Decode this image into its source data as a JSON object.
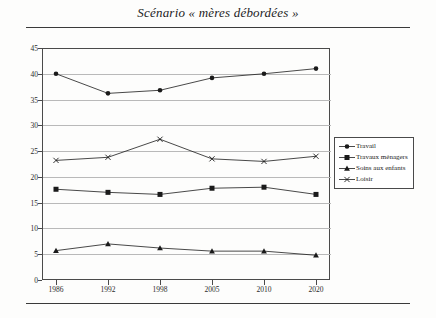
{
  "figure": {
    "title": "Scénario « mères débordées »"
  },
  "chart_data": {
    "type": "line",
    "title": "Scénario « mères débordées »",
    "xlabel": "",
    "ylabel": "",
    "categories": [
      "1986",
      "1992",
      "1998",
      "2005",
      "2010",
      "2020"
    ],
    "x": [
      1986,
      1992,
      1998,
      2005,
      2010,
      2020
    ],
    "ylim": [
      0,
      45
    ],
    "ytick_values": [
      0,
      5,
      10,
      15,
      20,
      25,
      30,
      35,
      40,
      45
    ],
    "ytick_labels": [
      "0",
      "5",
      "10",
      "15",
      "20",
      "25",
      "30",
      "35",
      "40",
      "45"
    ],
    "grid": true,
    "legend_position": "right",
    "series": [
      {
        "name": "Travail",
        "marker": "circle",
        "color": "#1a1a1a",
        "values": [
          40.0,
          36.2,
          36.8,
          39.2,
          40.0,
          41.0
        ]
      },
      {
        "name": "Travaux ménagers",
        "marker": "square",
        "color": "#1a1a1a",
        "values": [
          17.6,
          17.0,
          16.6,
          17.8,
          18.0,
          16.6
        ]
      },
      {
        "name": "Soins aux enfants",
        "marker": "triangle",
        "color": "#1a1a1a",
        "values": [
          5.7,
          7.0,
          6.2,
          5.6,
          5.6,
          4.8
        ]
      },
      {
        "name": "Loisir",
        "marker": "x",
        "color": "#1a1a1a",
        "values": [
          23.2,
          23.8,
          27.3,
          23.5,
          23.0,
          24.0
        ]
      }
    ]
  },
  "legend": {
    "items": [
      {
        "label": "Travail",
        "marker": "circle"
      },
      {
        "label": "Travaux ménagers",
        "marker": "square"
      },
      {
        "label": "Soins aux enfants",
        "marker": "triangle"
      },
      {
        "label": "Loisir",
        "marker": "x"
      }
    ]
  },
  "colors": {
    "ink": "#1a1a1a",
    "frame": "#4a4a4a",
    "gridline": "#b9b9b9",
    "background": "#fdfdfc"
  }
}
